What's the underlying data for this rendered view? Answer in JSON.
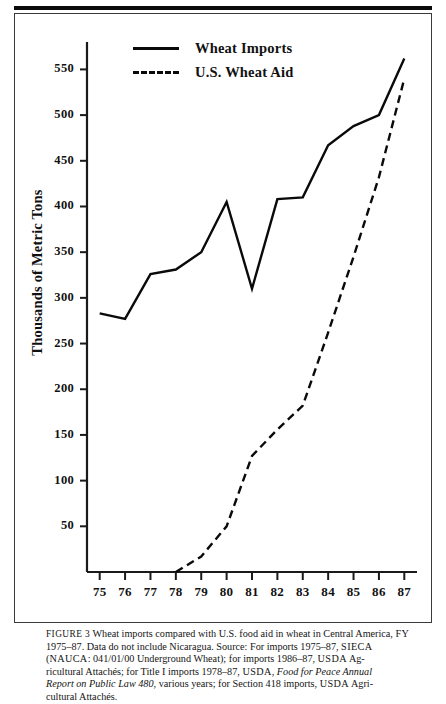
{
  "figure": {
    "number_label": "FIGURE 3",
    "caption_segments": {
      "l1_a": "Wheat imports compared with U.S. food aid in wheat in Central America, ",
      "l1_fy": "FY",
      "l2_a": "1975–87. Data do not include Nicaragua. Source: For imports 1975–87, ",
      "l2_sieca": "SIECA",
      "l3_nauca": "NAUCA",
      "l3_a": ": 041/01/00 Underground Wheat); for imports 1986–87, ",
      "l3_usda": "USDA",
      "l3_b": " Ag-",
      "l4_a": "ricultural Attachés; for  Title I imports 1978–87, ",
      "l4_usda": "USDA",
      "l4_b": ", ",
      "l4_italic": "Food for Peace Annual",
      "l5_italic": "Report on Public Law 480",
      "l5_a": ", various years; for Section 418 imports, ",
      "l5_usda": "USDA",
      "l5_b": " Agri-",
      "l6_a": "cultural Attachés."
    }
  },
  "chart_data": {
    "type": "line",
    "title": "",
    "subtitle": "",
    "xlabel": "",
    "ylabel": "Thousands of Metric Tons",
    "xlim": [
      74.5,
      87.5
    ],
    "ylim": [
      0,
      580
    ],
    "grid": false,
    "legend_position": "top-center",
    "x": [
      75,
      76,
      77,
      78,
      79,
      80,
      81,
      82,
      83,
      84,
      85,
      86,
      87
    ],
    "categories": [
      "75",
      "76",
      "77",
      "78",
      "79",
      "80",
      "81",
      "82",
      "83",
      "84",
      "85",
      "86",
      "87"
    ],
    "y_ticks": [
      50,
      100,
      150,
      200,
      250,
      300,
      350,
      400,
      450,
      500,
      550
    ],
    "y_tick_labels": [
      "50",
      "100",
      "150",
      "200",
      "250",
      "300",
      "350",
      "400",
      "450",
      "500",
      "550"
    ],
    "series": [
      {
        "name": "Wheat Imports",
        "style": "solid",
        "color": "#0a0a0a",
        "values": [
          283,
          277,
          326,
          331,
          350,
          405,
          310,
          408,
          410,
          467,
          488,
          500,
          562
        ]
      },
      {
        "name": "U.S. Wheat Aid",
        "style": "dashed",
        "color": "#0a0a0a",
        "x": [
          78,
          79,
          80,
          81,
          82,
          83,
          84,
          85,
          86,
          87
        ],
        "values": [
          0,
          17,
          50,
          127,
          156,
          182,
          262,
          345,
          432,
          540
        ]
      }
    ]
  },
  "legend": {
    "items": [
      {
        "label": "Wheat Imports",
        "style": "solid"
      },
      {
        "label": "U.S. Wheat Aid",
        "style": "dashed"
      }
    ]
  }
}
